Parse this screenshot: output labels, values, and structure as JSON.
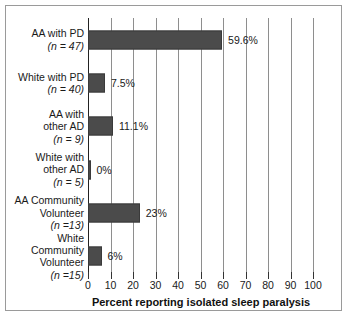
{
  "chart_data": {
    "type": "bar",
    "orientation": "horizontal",
    "title": "",
    "xlabel": "Percent reporting isolated sleep paralysis",
    "ylabel": "",
    "xlim": [
      0,
      100
    ],
    "xticks": [
      0,
      10,
      20,
      30,
      40,
      50,
      60,
      70,
      80,
      90,
      100
    ],
    "grid": "vertical",
    "legend": "none",
    "bar_color": "#4b4b4b",
    "categories": [
      "AA with PD",
      "White with PD",
      "AA with other AD",
      "White with other AD",
      "AA Community Volunteer",
      "White Community Volunteer"
    ],
    "values": [
      59.6,
      7.5,
      11.1,
      0,
      23,
      6
    ],
    "data_labels": [
      "59.6%",
      "7.5%",
      "11.1%",
      "0%",
      "23%",
      "6%"
    ],
    "group_sizes": [
      47,
      40,
      9,
      5,
      13,
      15
    ],
    "rows": [
      {
        "lines": [
          "AA with PD"
        ],
        "n_text": "(n = 47)",
        "value": 59.6,
        "label": "59.6%"
      },
      {
        "lines": [
          "White with PD"
        ],
        "n_text": "(n = 40)",
        "value": 7.5,
        "label": "7.5%"
      },
      {
        "lines": [
          "AA with",
          "other AD"
        ],
        "n_text": "(n = 9)",
        "value": 11.1,
        "label": "11.1%"
      },
      {
        "lines": [
          "White with",
          "other AD"
        ],
        "n_text": "(n = 5)",
        "value": 0,
        "label": "0%"
      },
      {
        "lines": [
          "AA Community",
          "Volunteer"
        ],
        "n_text": "(n =13)",
        "value": 23,
        "label": "23%"
      },
      {
        "lines": [
          "White",
          "Community",
          "Volunteer"
        ],
        "n_text": "(n =15)",
        "value": 6,
        "label": "6%"
      }
    ]
  }
}
